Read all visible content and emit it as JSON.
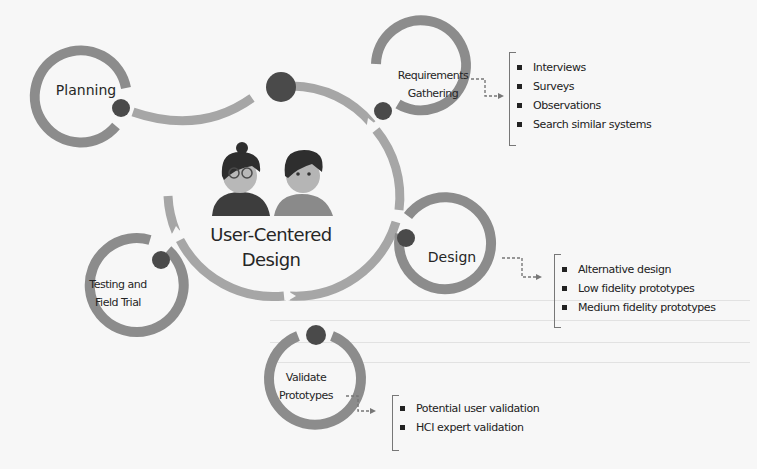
{
  "diagram": {
    "center": {
      "label_line1": "User-Centered",
      "label_line2": "Design",
      "icon": "two-users-illustration"
    },
    "stages": [
      {
        "id": "planning",
        "lines": [
          "Planning"
        ]
      },
      {
        "id": "requirements",
        "lines": [
          "Requirements",
          "Gathering"
        ]
      },
      {
        "id": "design",
        "lines": [
          "Design"
        ]
      },
      {
        "id": "validate",
        "lines": [
          "Validate",
          "Prototypes"
        ]
      },
      {
        "id": "testing",
        "lines": [
          "Testing and",
          "Field Trial"
        ]
      }
    ],
    "details": {
      "requirements": [
        "Interviews",
        "Surveys",
        "Observations",
        "Search similar systems"
      ],
      "design": [
        "Alternative design",
        "Low fidelity prototypes",
        "Medium fidelity prototypes"
      ],
      "validate": [
        "Potential user validation",
        "HCI expert validation"
      ]
    },
    "colors": {
      "ring": "#8c8c8c",
      "arc": "#a6a6a6",
      "node": "#4a4a4a",
      "text": "#262626",
      "background": "#f7f7f7"
    }
  }
}
